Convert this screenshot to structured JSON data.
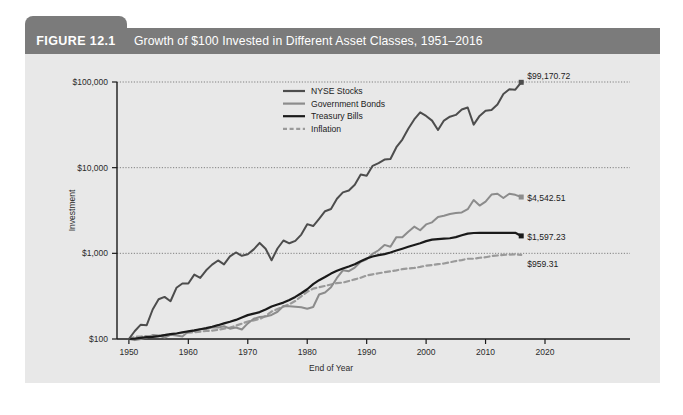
{
  "figure": {
    "number_label": "FIGURE 12.1",
    "title": "Growth of $100 Invested in Different Asset Classes, 1951–2016",
    "header_bg": "#7b7b7b",
    "panel_bg": "#e8e8e8"
  },
  "chart_data": {
    "type": "line",
    "title": "Growth of $100 Invested in Different Asset Classes, 1951–2016",
    "xlabel": "End of Year",
    "ylabel": "Investment",
    "yscale": "log",
    "ylim": [
      100,
      100000
    ],
    "xlim": [
      1948,
      2020
    ],
    "grid": "horizontal-dotted",
    "legend_position": "top-center",
    "ytick_labels": [
      "$100",
      "$1,000",
      "$10,000",
      "$100,000"
    ],
    "ytick_values": [
      100,
      1000,
      10000,
      100000
    ],
    "xtick_labels": [
      "1950",
      "1960",
      "1970",
      "1980",
      "1990",
      "2000",
      "2010",
      "2020"
    ],
    "xtick_values": [
      1950,
      1960,
      1970,
      1980,
      1990,
      2000,
      2010,
      2020
    ],
    "x": [
      1950,
      1951,
      1952,
      1953,
      1954,
      1955,
      1956,
      1957,
      1958,
      1959,
      1960,
      1961,
      1962,
      1963,
      1964,
      1965,
      1966,
      1967,
      1968,
      1969,
      1970,
      1971,
      1972,
      1973,
      1974,
      1975,
      1976,
      1977,
      1978,
      1979,
      1980,
      1981,
      1982,
      1983,
      1984,
      1985,
      1986,
      1987,
      1988,
      1989,
      1990,
      1991,
      1992,
      1993,
      1994,
      1995,
      1996,
      1997,
      1998,
      1999,
      2000,
      2001,
      2002,
      2003,
      2004,
      2005,
      2006,
      2007,
      2008,
      2009,
      2010,
      2011,
      2012,
      2013,
      2014,
      2015,
      2016
    ],
    "series": [
      {
        "name": "NYSE Stocks",
        "color": "#4d4d4d",
        "width": 2.0,
        "dash": "none",
        "end_label": "$99,170.72",
        "end_value": 99170.72,
        "values": [
          100,
          124,
          147,
          145,
          221,
          291,
          310,
          276,
          396,
          444,
          445,
          565,
          516,
          634,
          738,
          826,
          743,
          921,
          1023,
          936,
          974,
          1112,
          1323,
          1129,
          830,
          1139,
          1411,
          1310,
          1396,
          1654,
          2191,
          2082,
          2531,
          3100,
          3295,
          4340,
          5146,
          5416,
          6316,
          8313,
          8055,
          10504,
          11302,
          12437,
          12600,
          17324,
          21305,
          28402,
          36528,
          44197,
          40163,
          35390,
          27580,
          35492,
          39357,
          41290,
          47800,
          50440,
          31780,
          40180,
          46210,
          47150,
          54680,
          72380,
          82250,
          81340,
          99170.72
        ]
      },
      {
        "name": "Government Bonds",
        "color": "#8c8c8c",
        "width": 2.0,
        "dash": "none",
        "end_label": "$4,542.51",
        "end_value": 4542.51,
        "values": [
          100,
          97,
          100,
          104,
          111,
          110,
          104,
          112,
          110,
          107,
          122,
          124,
          130,
          131,
          136,
          136,
          141,
          132,
          136,
          129,
          152,
          172,
          181,
          183,
          191,
          208,
          243,
          241,
          238,
          235,
          226,
          236,
          331,
          349,
          401,
          516,
          633,
          619,
          682,
          796,
          850,
          988,
          1086,
          1254,
          1194,
          1545,
          1538,
          1790,
          2049,
          1860,
          2175,
          2299,
          2662,
          2744,
          2883,
          2960,
          3002,
          3274,
          4190,
          3610,
          4010,
          4850,
          4960,
          4420,
          4960,
          4820,
          4542.51
        ]
      },
      {
        "name": "Treasury Bills",
        "color": "#1a1a1a",
        "width": 2.2,
        "dash": "none",
        "end_label": "$1,597.23",
        "end_value": 1597.23,
        "values": [
          100,
          101,
          103,
          105,
          106,
          108,
          111,
          114,
          116,
          120,
          123,
          126,
          130,
          134,
          139,
          145,
          152,
          159,
          167,
          178,
          190,
          198,
          206,
          221,
          239,
          253,
          266,
          285,
          310,
          342,
          381,
          438,
          486,
          529,
          580,
          625,
          665,
          701,
          745,
          807,
          870,
          919,
          951,
          979,
          1021,
          1078,
          1133,
          1192,
          1253,
          1311,
          1388,
          1444,
          1468,
          1483,
          1500,
          1548,
          1624,
          1700,
          1727,
          1730,
          1731,
          1731,
          1732,
          1733,
          1733,
          1734,
          1597.23
        ]
      },
      {
        "name": "Inflation",
        "color": "#9a9a9a",
        "width": 2.2,
        "dash": "dashed",
        "end_label": "$959.31",
        "end_value": 959.31,
        "values": [
          100,
          106,
          107,
          108,
          107,
          108,
          111,
          114,
          116,
          118,
          119,
          120,
          122,
          124,
          125,
          128,
          132,
          136,
          143,
          151,
          160,
          165,
          171,
          186,
          209,
          224,
          239,
          255,
          278,
          315,
          355,
          387,
          402,
          417,
          433,
          450,
          455,
          475,
          496,
          519,
          551,
          568,
          585,
          601,
          617,
          633,
          654,
          665,
          676,
          694,
          718,
          729,
          747,
          761,
          786,
          813,
          834,
          864,
          864,
          888,
          901,
          928,
          944,
          959,
          967,
          974,
          959.31
        ]
      }
    ]
  }
}
